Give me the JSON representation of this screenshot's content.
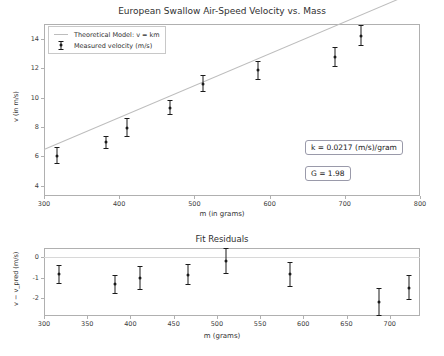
{
  "chart_data": [
    {
      "type": "scatter",
      "id": "main",
      "title": "European Swallow Air-Speed Velocity vs. Mass",
      "xlabel": "m (in grams)",
      "ylabel": "v (in m/s)",
      "xlim": [
        300,
        800
      ],
      "ylim": [
        3.3,
        15.0
      ],
      "xticks": [
        300,
        400,
        500,
        600,
        700,
        800
      ],
      "yticks": [
        4,
        6,
        8,
        10,
        12,
        14
      ],
      "grid": false,
      "legend_position": "upper left",
      "series": [
        {
          "name": "Theoretical Model: v = km",
          "type": "line",
          "color": "#bdbdbd",
          "slope": 0.0217,
          "intercept": 0,
          "x": [
            300,
            800
          ],
          "values": [
            6.51,
            17.36
          ]
        },
        {
          "name": "Measured velocity (m/s)",
          "type": "errorbar",
          "color": "#1a1a1a",
          "x": [
            317,
            382,
            411,
            467,
            511,
            585,
            687,
            722
          ],
          "values": [
            6.05,
            6.95,
            7.95,
            9.3,
            10.95,
            11.85,
            12.75,
            14.2
          ],
          "yerr": [
            0.55,
            0.45,
            0.65,
            0.5,
            0.6,
            0.65,
            0.7,
            0.7
          ]
        }
      ],
      "annotations": [
        {
          "name": "k-annotation",
          "text": "k = 0.0217 (m/s)/gram"
        },
        {
          "name": "g-annotation",
          "text": "G = 1.98"
        }
      ]
    },
    {
      "type": "scatter",
      "id": "residuals",
      "title": "Fit Residuals",
      "xlabel": "m (grams)",
      "ylabel": "v − v_pred (m/s)",
      "xlim": [
        300,
        735
      ],
      "ylim": [
        -2.85,
        0.45
      ],
      "xticks": [
        300,
        350,
        400,
        450,
        500,
        550,
        600,
        650,
        700
      ],
      "yticks": [
        0,
        -1,
        -2
      ],
      "grid": false,
      "series": [
        {
          "name": "zero-line",
          "type": "line",
          "color": "#d8d8d8",
          "x": [
            300,
            735
          ],
          "values": [
            0,
            0
          ]
        },
        {
          "name": "residuals",
          "type": "errorbar",
          "color": "#1a1a1a",
          "x": [
            317,
            382,
            411,
            467,
            511,
            585,
            687,
            722
          ],
          "values": [
            -0.83,
            -1.32,
            -1.0,
            -0.84,
            -0.19,
            -0.83,
            -2.16,
            -1.47
          ],
          "yerr": [
            0.45,
            0.45,
            0.6,
            0.5,
            0.62,
            0.62,
            0.68,
            0.62
          ]
        }
      ]
    }
  ]
}
